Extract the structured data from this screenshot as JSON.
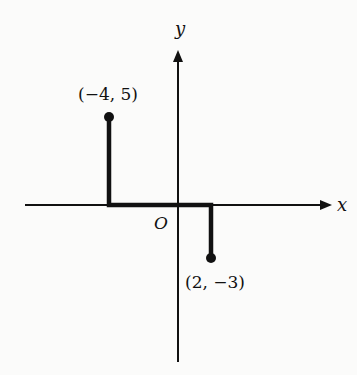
{
  "diagram": {
    "axes": {
      "x_label": "x",
      "y_label": "y",
      "origin_label": "O"
    },
    "points": [
      {
        "label": "(−4, 5)",
        "x": -4,
        "y": 5
      },
      {
        "label": "(2, −3)",
        "x": 2,
        "y": -3
      }
    ],
    "path_description": "Bold path from (-4,5) down to (-4,0), along x-axis to (2,0), down to (2,-3)"
  }
}
